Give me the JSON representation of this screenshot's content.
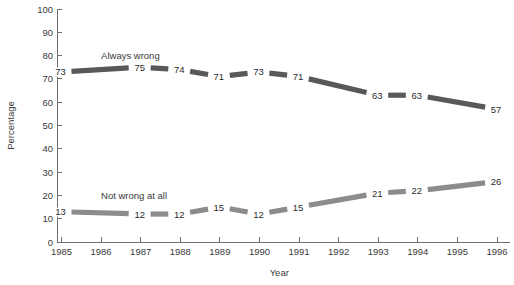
{
  "chart_data": {
    "type": "line",
    "title": "",
    "xlabel": "Year",
    "ylabel": "Percentage",
    "x": [
      1985,
      1986,
      1987,
      1988,
      1989,
      1990,
      1991,
      1992,
      1993,
      1994,
      1995,
      1996
    ],
    "xtick_labels": [
      "1985",
      "1986",
      "1987",
      "1988",
      "1989",
      "1990",
      "1991",
      "1992",
      "1993",
      "1994",
      "1995",
      "1996"
    ],
    "ytick_labels": [
      "0",
      "10",
      "20",
      "30",
      "40",
      "50",
      "60",
      "70",
      "80",
      "90",
      "100"
    ],
    "yticks": [
      0,
      10,
      20,
      30,
      40,
      50,
      60,
      70,
      80,
      90,
      100
    ],
    "ylim": [
      0,
      100
    ],
    "xlim": [
      1985,
      1996
    ],
    "grid": false,
    "legend_position": "inline-annotation",
    "series": [
      {
        "name": "Always wrong",
        "color": "#595959",
        "label_position": {
          "x": 1986.0,
          "y": 80
        },
        "values": [
          73,
          null,
          75,
          74,
          71,
          73,
          71,
          null,
          63,
          63,
          null,
          57
        ],
        "point_labels": [
          "73",
          "",
          "75",
          "74",
          "71",
          "73",
          "71",
          "",
          "63",
          "63",
          "",
          "57"
        ]
      },
      {
        "name": "Not wrong at all",
        "color": "#8c8c8c",
        "label_position": {
          "x": 1986.0,
          "y": 20
        },
        "values": [
          13,
          null,
          12,
          12,
          15,
          12,
          15,
          null,
          21,
          22,
          null,
          26
        ],
        "point_labels": [
          "13",
          "",
          "12",
          "12",
          "15",
          "12",
          "15",
          "",
          "21",
          "22",
          "",
          "26"
        ]
      }
    ]
  }
}
